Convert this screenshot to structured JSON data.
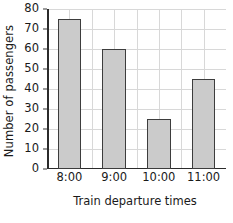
{
  "chart_data": {
    "type": "bar",
    "title": "",
    "categories": [
      "8:00",
      "9:00",
      "10:00",
      "11:00"
    ],
    "values": [
      75,
      60,
      25,
      45
    ],
    "series": [
      {
        "name": "Number of passengers",
        "values": [
          75,
          60,
          25,
          45
        ]
      }
    ],
    "xlabel": "Train departure times",
    "ylabel": "Number of passengers",
    "ylim": [
      0,
      80
    ],
    "ytick_values": [
      0,
      10,
      20,
      30,
      40,
      50,
      60,
      70,
      80
    ],
    "ytick_labels": [
      "0",
      "10",
      "20",
      "30",
      "40",
      "50",
      "60",
      "70",
      "80"
    ],
    "ytick_step": 10,
    "grid": true,
    "grid_axis": "both",
    "legend": false,
    "legend_position": "none",
    "bar_fill_color": "#cbcbcb",
    "bar_edge_color": "#3d3d3d",
    "grid_color": "#d8d8d8",
    "axis_color": "#2b2b2b",
    "background_color": "#ffffff"
  }
}
